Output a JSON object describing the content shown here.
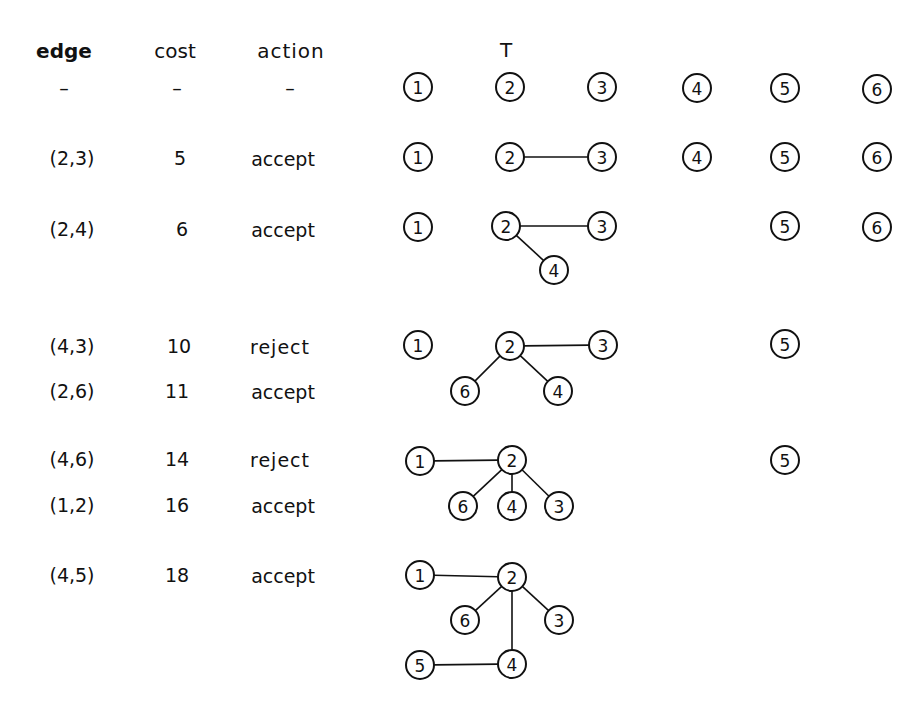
{
  "table": {
    "headers": {
      "edge": "edge",
      "cost": "cost",
      "action": "action",
      "tree": "T"
    },
    "rows": [
      {
        "edge": "–",
        "cost": "–",
        "action": "–"
      },
      {
        "edge": "(2,3)",
        "cost": "5",
        "action": "accept"
      },
      {
        "edge": "(2,4)",
        "cost": "6",
        "action": "accept"
      },
      {
        "edge": "(4,3)",
        "cost": "10",
        "action": "reject"
      },
      {
        "edge": "(2,6)",
        "cost": "11",
        "action": "accept"
      },
      {
        "edge": "(4,6)",
        "cost": "14",
        "action": "reject"
      },
      {
        "edge": "(1,2)",
        "cost": "16",
        "action": "accept"
      },
      {
        "edge": "(4,5)",
        "cost": "18",
        "action": "accept"
      }
    ]
  },
  "forest_stages": [
    {
      "label": "initial",
      "nodes": [
        {
          "id": "1",
          "x": 418,
          "y": 87
        },
        {
          "id": "2",
          "x": 510,
          "y": 87
        },
        {
          "id": "3",
          "x": 602,
          "y": 87
        },
        {
          "id": "4",
          "x": 697,
          "y": 88
        },
        {
          "id": "5",
          "x": 785,
          "y": 88
        },
        {
          "id": "6",
          "x": 877,
          "y": 89
        }
      ],
      "edges": []
    },
    {
      "label": "after (2,3)",
      "nodes": [
        {
          "id": "1",
          "x": 418,
          "y": 157
        },
        {
          "id": "2",
          "x": 510,
          "y": 157
        },
        {
          "id": "3",
          "x": 602,
          "y": 157
        },
        {
          "id": "4",
          "x": 697,
          "y": 157
        },
        {
          "id": "5",
          "x": 785,
          "y": 157
        },
        {
          "id": "6",
          "x": 877,
          "y": 157
        }
      ],
      "edges": [
        [
          "2",
          "3"
        ]
      ]
    },
    {
      "label": "after (2,4)",
      "nodes": [
        {
          "id": "1",
          "x": 418,
          "y": 227
        },
        {
          "id": "2",
          "x": 506,
          "y": 226
        },
        {
          "id": "3",
          "x": 602,
          "y": 226
        },
        {
          "id": "4",
          "x": 554,
          "y": 270
        },
        {
          "id": "5",
          "x": 785,
          "y": 226
        },
        {
          "id": "6",
          "x": 877,
          "y": 227
        }
      ],
      "edges": [
        [
          "2",
          "3"
        ],
        [
          "2",
          "4"
        ]
      ]
    },
    {
      "label": "after (4,3) reject, (2,6)",
      "nodes": [
        {
          "id": "1",
          "x": 418,
          "y": 345
        },
        {
          "id": "2",
          "x": 510,
          "y": 346
        },
        {
          "id": "3",
          "x": 603,
          "y": 345
        },
        {
          "id": "6",
          "x": 465,
          "y": 391
        },
        {
          "id": "4",
          "x": 558,
          "y": 391
        },
        {
          "id": "5",
          "x": 785,
          "y": 344
        }
      ],
      "edges": [
        [
          "2",
          "3"
        ],
        [
          "2",
          "6"
        ],
        [
          "2",
          "4"
        ]
      ]
    },
    {
      "label": "after (4,6) reject, (1,2)",
      "nodes": [
        {
          "id": "1",
          "x": 420,
          "y": 461
        },
        {
          "id": "2",
          "x": 512,
          "y": 460
        },
        {
          "id": "6",
          "x": 463,
          "y": 506
        },
        {
          "id": "4",
          "x": 512,
          "y": 506
        },
        {
          "id": "3",
          "x": 559,
          "y": 506
        },
        {
          "id": "5",
          "x": 785,
          "y": 460
        }
      ],
      "edges": [
        [
          "1",
          "2"
        ],
        [
          "2",
          "6"
        ],
        [
          "2",
          "4"
        ],
        [
          "2",
          "3"
        ]
      ]
    },
    {
      "label": "after (4,5)",
      "nodes": [
        {
          "id": "1",
          "x": 420,
          "y": 575
        },
        {
          "id": "2",
          "x": 512,
          "y": 577
        },
        {
          "id": "6",
          "x": 465,
          "y": 620
        },
        {
          "id": "3",
          "x": 559,
          "y": 620
        },
        {
          "id": "5",
          "x": 420,
          "y": 665
        },
        {
          "id": "4",
          "x": 512,
          "y": 664
        }
      ],
      "edges": [
        [
          "1",
          "2"
        ],
        [
          "2",
          "6"
        ],
        [
          "2",
          "3"
        ],
        [
          "2",
          "4"
        ],
        [
          "5",
          "4"
        ]
      ]
    }
  ],
  "colors": {
    "ink": "#111111",
    "paper": "#ffffff"
  }
}
